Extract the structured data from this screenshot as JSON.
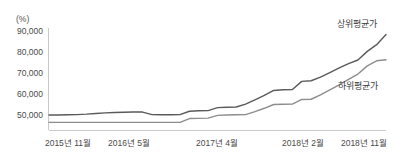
{
  "chart_data": {
    "type": "line",
    "title": "",
    "subtitle": "",
    "unit_label": "(%)",
    "xlabel": "",
    "ylabel": "",
    "ylim": [
      44000,
      94000
    ],
    "y_ticks": [
      "50,000",
      "60,000",
      "70,000",
      "80,000",
      "90,000"
    ],
    "y_tick_values": [
      50000,
      60000,
      70000,
      80000,
      90000
    ],
    "x_tick_labels": [
      "2015년 11월",
      "2016년 5월",
      "2017년 4월",
      "2018년 2월",
      "2018년 11월"
    ],
    "x_tick_values": [
      0,
      6,
      17,
      27,
      36
    ],
    "grid": false,
    "legend_position": "inline-right",
    "x": [
      0,
      1,
      2,
      3,
      4,
      5,
      6,
      7,
      8,
      9,
      10,
      11,
      12,
      13,
      14,
      15,
      16,
      17,
      18,
      19,
      20,
      21,
      22,
      23,
      24,
      25,
      26,
      27,
      28,
      29,
      30,
      31,
      32,
      33,
      34,
      35,
      36
    ],
    "series": [
      {
        "name": "상위평균가",
        "color": "#5a5a5a",
        "values": [
          50000,
          50000,
          50100,
          50200,
          50400,
          50700,
          51000,
          51200,
          51300,
          51400,
          51400,
          50200,
          50100,
          50100,
          50200,
          51800,
          52000,
          52100,
          53500,
          53700,
          53800,
          55200,
          57200,
          59300,
          61700,
          62000,
          62100,
          66000,
          66300,
          68000,
          70200,
          72400,
          74500,
          76200,
          80300,
          83500,
          88300
        ]
      },
      {
        "name": "하위평균가",
        "color": "#8d8d8d",
        "values": [
          46500,
          46500,
          46500,
          46500,
          46500,
          46500,
          46500,
          46500,
          46500,
          46500,
          46500,
          46500,
          46500,
          46500,
          46500,
          48300,
          48400,
          48500,
          49800,
          50000,
          50100,
          50200,
          51600,
          53200,
          55000,
          55100,
          55200,
          57400,
          57500,
          59600,
          62000,
          64400,
          67000,
          69500,
          73400,
          75800,
          76300
        ]
      }
    ]
  }
}
